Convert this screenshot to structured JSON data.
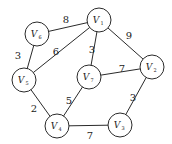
{
  "graph": {
    "type": "weighted-undirected-graph",
    "node_radius": 12,
    "nodes": [
      {
        "id": "V1",
        "letter": "V",
        "sub": "1",
        "x": 99,
        "y": 20
      },
      {
        "id": "V2",
        "letter": "V",
        "sub": "2",
        "x": 152,
        "y": 67
      },
      {
        "id": "V3",
        "letter": "V",
        "sub": "3",
        "x": 120,
        "y": 125
      },
      {
        "id": "V4",
        "letter": "V",
        "sub": "4",
        "x": 57,
        "y": 126
      },
      {
        "id": "V5",
        "letter": "V",
        "sub": "5",
        "x": 24,
        "y": 80
      },
      {
        "id": "V6",
        "letter": "V",
        "sub": "6",
        "x": 37,
        "y": 34
      },
      {
        "id": "V7",
        "letter": "V",
        "sub": "7",
        "x": 89,
        "y": 77
      }
    ],
    "edges": [
      {
        "from": "V6",
        "to": "V1",
        "weight": "8",
        "lx": 66,
        "ly": 23
      },
      {
        "from": "V6",
        "to": "V5",
        "weight": "3",
        "lx": 18,
        "ly": 59
      },
      {
        "from": "V1",
        "to": "V5",
        "weight": "6",
        "lx": 56,
        "ly": 55
      },
      {
        "from": "V1",
        "to": "V7",
        "weight": "3",
        "lx": 92,
        "ly": 53
      },
      {
        "from": "V1",
        "to": "V2",
        "weight": "9",
        "lx": 129,
        "ly": 39
      },
      {
        "from": "V7",
        "to": "V2",
        "weight": "7",
        "lx": 122,
        "ly": 72
      },
      {
        "from": "V5",
        "to": "V4",
        "weight": "2",
        "lx": 34,
        "ly": 112
      },
      {
        "from": "V7",
        "to": "V4",
        "weight": "5",
        "lx": 69,
        "ly": 104
      },
      {
        "from": "V2",
        "to": "V3",
        "weight": "3",
        "lx": 133,
        "ly": 101
      },
      {
        "from": "V4",
        "to": "V3",
        "weight": "7",
        "lx": 90,
        "ly": 139
      }
    ]
  }
}
